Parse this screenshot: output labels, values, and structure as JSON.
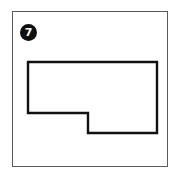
{
  "figure": {
    "number_label": "7",
    "badge_icon": "filled-circle-number-badge",
    "frame": {
      "x": 12,
      "y": 11,
      "width": 156,
      "height": 156,
      "border_color": "#5a5a5a",
      "background_color": "#ffffff"
    },
    "badge": {
      "x": 20,
      "y": 24,
      "diameter": 17,
      "fill_color": "#0d0d0d",
      "text_color": "#ffffff"
    },
    "shape": {
      "name": "L-shaped-hexagon-outline",
      "description": "Hand-drawn rectilinear six-sided figure resembling a rectangle with a notch removed from the lower-left region",
      "stroke_color": "#111111",
      "stroke_width": 2.4,
      "fill": "none",
      "vertex_count": 6,
      "vertices": [
        {
          "label": "top-left",
          "x": 28,
          "y": 62
        },
        {
          "label": "top-right",
          "x": 157,
          "y": 62
        },
        {
          "label": "bottom-right",
          "x": 157,
          "y": 133
        },
        {
          "label": "notch-bottom-left",
          "x": 88,
          "y": 133
        },
        {
          "label": "notch-inner-corner",
          "x": 88,
          "y": 113
        },
        {
          "label": "left-step",
          "x": 28,
          "y": 113
        }
      ],
      "path": "M28,62 L157,62 L157,133 L88,133 L88,113 L28,113 Z"
    }
  }
}
